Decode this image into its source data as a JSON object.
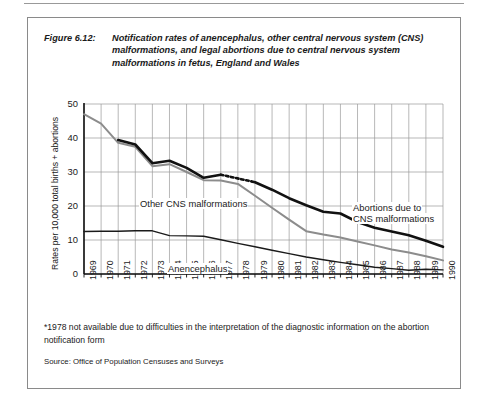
{
  "figure": {
    "label": "Figure 6.12:",
    "title": "Notification rates of anencephalus, other central nervous system (CNS) malformations, and legal abortions due to central nervous system malformations in fetus, England and Wales",
    "footnote": "*1978 not available due to difficulties in the interpretation of the diagnostic information on the abortion notification form",
    "source": "Source: Office of Population Censuses and Surveys"
  },
  "chart_data": {
    "type": "line",
    "title": "Notification rates of anencephalus, other central nervous system (CNS) malformations, and legal abortions due to central nervous system malformations in fetus, England and Wales",
    "xlabel": "",
    "ylabel": "Rates per 10,000 total births + abortions",
    "x": [
      1969,
      1970,
      1971,
      1972,
      1973,
      1974,
      1975,
      1976,
      1977,
      1978,
      1979,
      1980,
      1981,
      1982,
      1983,
      1984,
      1985,
      1986,
      1987,
      1988,
      1989,
      1990
    ],
    "xtick_labels": [
      "1969",
      "1970",
      "1971",
      "1972",
      "1973",
      "1974",
      "1975",
      "1976",
      "1977",
      "1978",
      "1979",
      "1980",
      "1981",
      "1982",
      "1983",
      "1984",
      "1985",
      "1986",
      "1987",
      "1988",
      "1989",
      "1990"
    ],
    "ytick_labels": [
      "0",
      "10",
      "20",
      "30",
      "40",
      "50"
    ],
    "yticks": [
      0,
      10,
      20,
      30,
      40,
      50
    ],
    "ylim": [
      0,
      50
    ],
    "grid": true,
    "legend_position": "inline-annotations",
    "series": [
      {
        "name": "Other CNS malformations",
        "color": "#8c8c8c",
        "width": 2.0,
        "values": [
          47.0,
          44.2,
          38.6,
          37.4,
          31.7,
          32.3,
          30.0,
          27.6,
          27.5,
          26.5,
          23.0,
          19.5,
          16.0,
          12.6,
          11.6,
          10.7,
          9.6,
          8.4,
          7.2,
          6.3,
          5.2,
          4.0
        ]
      },
      {
        "name": "Abortions due to CNS malformations",
        "color": "#111111",
        "width": 2.6,
        "dashed_segment": [
          1977,
          1979
        ],
        "values": [
          null,
          null,
          39.4,
          38.1,
          32.6,
          33.3,
          31.2,
          28.3,
          29.2,
          null,
          27.0,
          24.8,
          22.3,
          20.2,
          18.3,
          17.8,
          15.3,
          13.6,
          12.5,
          11.4,
          9.8,
          8.0
        ]
      },
      {
        "name": "Anencephalus",
        "color": "#1a1a1a",
        "width": 1.4,
        "values": [
          12.5,
          12.6,
          12.6,
          12.7,
          12.7,
          11.3,
          11.2,
          11.1,
          10.1,
          9.0,
          8.0,
          7.0,
          6.0,
          5.0,
          4.2,
          3.4,
          2.7,
          2.0,
          1.6,
          1.1,
          1.4,
          1.2
        ]
      }
    ],
    "annotations": [
      {
        "name": "other-cns-label",
        "text": "Other CNS malformations",
        "x_px": 111,
        "y_px": 180
      },
      {
        "name": "abortions-label",
        "text": "Abortions due to",
        "x_px": 324,
        "y_px": 184
      },
      {
        "name": "abortions-label-2",
        "text": "CNS malformations",
        "x_px": 324,
        "y_px": 195
      },
      {
        "name": "anencephalus-label",
        "text": "Anencephalus",
        "x_px": 139,
        "y_px": 245
      }
    ]
  }
}
